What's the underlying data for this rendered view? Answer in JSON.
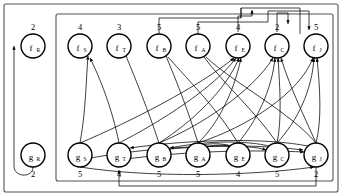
{
  "diagram": {
    "type": "bipartite-flow-graph",
    "outer_frame": {
      "x": 4,
      "y": 4,
      "width": 334,
      "height": 188
    },
    "inner_frame": {
      "x": 56,
      "y": 14,
      "width": 277,
      "height": 167
    },
    "top_row": {
      "label_prefix": "f",
      "nodes": [
        {
          "id": "f_R",
          "base": "f",
          "sub": "R",
          "weight": "2",
          "cx": 33,
          "cy": 46,
          "outside_frame": true
        },
        {
          "id": "f_S",
          "base": "f",
          "sub": "S",
          "weight": "4",
          "cx": 80,
          "cy": 46,
          "outside_frame": false
        },
        {
          "id": "f_T",
          "base": "f",
          "sub": "T",
          "weight": "3",
          "cx": 119,
          "cy": 46,
          "outside_frame": false
        },
        {
          "id": "f_B",
          "base": "f",
          "sub": "B",
          "weight": "5",
          "cx": 159,
          "cy": 46,
          "outside_frame": false
        },
        {
          "id": "f_A",
          "base": "f",
          "sub": "A",
          "weight": "5",
          "cx": 198,
          "cy": 46,
          "outside_frame": false
        },
        {
          "id": "f_E",
          "base": "f",
          "sub": "E",
          "weight": "4",
          "cx": 238,
          "cy": 46,
          "outside_frame": false
        },
        {
          "id": "f_C",
          "base": "f",
          "sub": "C",
          "weight": "2",
          "cx": 277,
          "cy": 46,
          "outside_frame": false
        },
        {
          "id": "f_J",
          "base": "f",
          "sub": "J",
          "weight": "5",
          "cx": 316,
          "cy": 46,
          "outside_frame": false
        }
      ]
    },
    "bottom_row": {
      "label_prefix": "g",
      "nodes": [
        {
          "id": "g_R",
          "base": "g",
          "sub": "R",
          "weight": "2",
          "cx": 33,
          "cy": 155,
          "outside_frame": true
        },
        {
          "id": "g_S",
          "base": "g",
          "sub": "S",
          "weight": "5",
          "cx": 80,
          "cy": 155,
          "outside_frame": false
        },
        {
          "id": "g_T",
          "base": "g",
          "sub": "T",
          "weight": "4",
          "cx": 119,
          "cy": 155,
          "outside_frame": false
        },
        {
          "id": "g_B",
          "base": "g",
          "sub": "B",
          "weight": "5",
          "cx": 159,
          "cy": 155,
          "outside_frame": false
        },
        {
          "id": "g_A",
          "base": "g",
          "sub": "A",
          "weight": "5",
          "cx": 198,
          "cy": 155,
          "outside_frame": false
        },
        {
          "id": "g_E",
          "base": "g",
          "sub": "E",
          "weight": "4",
          "cx": 238,
          "cy": 155,
          "outside_frame": false
        },
        {
          "id": "g_C",
          "base": "g",
          "sub": "C",
          "weight": "5",
          "cx": 277,
          "cy": 155,
          "outside_frame": false
        },
        {
          "id": "g_J",
          "base": "g",
          "sub": "J",
          "weight": "2",
          "cx": 316,
          "cy": 155,
          "outside_frame": false
        }
      ]
    },
    "node_radius": 12,
    "colors": {
      "node_stroke": "#000000",
      "node_fill": "#ffffff",
      "edge": "#000000",
      "frame": "#555555",
      "text": "#000000"
    },
    "edges_curved": [
      {
        "from": "g_S",
        "to": "f_S"
      },
      {
        "from": "g_T",
        "to": "f_S"
      },
      {
        "from": "g_B",
        "to": "f_T"
      },
      {
        "from": "g_A",
        "to": "f_B"
      },
      {
        "from": "g_E",
        "to": "f_B"
      },
      {
        "from": "g_C",
        "to": "f_A"
      },
      {
        "from": "g_J",
        "to": "f_A"
      },
      {
        "from": "g_S",
        "to": "f_E"
      },
      {
        "from": "g_T",
        "to": "f_E"
      },
      {
        "from": "g_B",
        "to": "f_E"
      },
      {
        "from": "g_A",
        "to": "f_E"
      },
      {
        "from": "g_E",
        "to": "f_C"
      },
      {
        "from": "g_C",
        "to": "f_C"
      },
      {
        "from": "g_J",
        "to": "f_C"
      },
      {
        "from": "g_C",
        "to": "f_J"
      },
      {
        "from": "g_J",
        "to": "f_J"
      },
      {
        "from": "g_A",
        "to": "f_J"
      },
      {
        "from": "g_B",
        "to": "f_C"
      }
    ],
    "edges_orthogonal": [
      {
        "from": "f_B",
        "to": "g_B",
        "kind": "top-bus"
      },
      {
        "from": "f_A",
        "to": "g_A",
        "kind": "top-bus"
      },
      {
        "from": "f_E",
        "to": "g_E",
        "kind": "top-bus"
      },
      {
        "from": "f_C",
        "to": "g_C",
        "kind": "top-bus"
      },
      {
        "from": "g_J",
        "to": "g_T",
        "kind": "bottom-bus"
      },
      {
        "from": "g_R",
        "to": "f_R",
        "kind": "left-loop"
      }
    ]
  }
}
